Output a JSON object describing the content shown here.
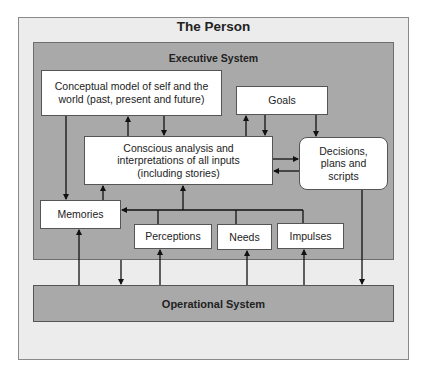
{
  "diagram": {
    "title": "The Person",
    "executive_system": {
      "label": "Executive System",
      "nodes": {
        "conceptual_model": "Conceptual model of self and the world (past, present and future)",
        "goals": "Goals",
        "conscious_analysis": "Conscious analysis and interpretations of all inputs (including stories)",
        "decisions": "Decisions, plans and scripts",
        "memories": "Memories",
        "perceptions": "Perceptions",
        "needs": "Needs",
        "impulses": "Impulses"
      }
    },
    "operational_system": {
      "label": "Operational System"
    },
    "edges": [
      {
        "from": "conceptual_model",
        "to": "memories"
      },
      {
        "from": "conscious_analysis",
        "to": "conceptual_model"
      },
      {
        "from": "conceptual_model",
        "to": "conscious_analysis"
      },
      {
        "from": "conscious_analysis",
        "to": "goals"
      },
      {
        "from": "goals",
        "to": "conscious_analysis"
      },
      {
        "from": "goals",
        "to": "decisions"
      },
      {
        "from": "conscious_analysis",
        "to": "decisions"
      },
      {
        "from": "decisions",
        "to": "conscious_analysis"
      },
      {
        "from": "memories",
        "to": "conscious_analysis"
      },
      {
        "from": "perceptions",
        "to": "memories"
      },
      {
        "from": "needs",
        "to": "memories"
      },
      {
        "from": "impulses",
        "to": "memories"
      },
      {
        "from": "perceptions",
        "to": "conscious_analysis"
      },
      {
        "from": "needs",
        "to": "conscious_analysis"
      },
      {
        "from": "impulses",
        "to": "conscious_analysis"
      },
      {
        "from": "operational_system",
        "to": "memories"
      },
      {
        "from": "executive_system",
        "to": "operational_system"
      },
      {
        "from": "operational_system",
        "to": "perceptions"
      },
      {
        "from": "operational_system",
        "to": "needs"
      },
      {
        "from": "operational_system",
        "to": "impulses"
      },
      {
        "from": "decisions",
        "to": "operational_system"
      }
    ]
  }
}
